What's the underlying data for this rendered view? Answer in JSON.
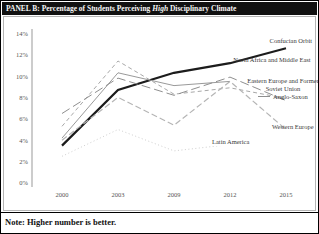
{
  "header": {
    "title_prefix": "PANEL B: Percentage of Students Perceiving ",
    "title_italic": "High",
    "title_suffix": " Disciplinary Climate",
    "bg_color": "#111111",
    "text_color": "#f5f5f5"
  },
  "note": {
    "text": "Note: Higher number is better."
  },
  "chart_data": {
    "type": "line",
    "title": "PANEL B: Percentage of Students Perceiving High Disciplinary Climate",
    "x_labels": [
      "2000",
      "2003",
      "2009",
      "2012",
      "2015"
    ],
    "xlabel": "",
    "ylabel": "",
    "ylim": [
      0,
      14
    ],
    "ytick_labels": [
      "14%",
      "12%",
      "10%",
      "8%",
      "6%",
      "4%",
      "2%",
      "0%"
    ],
    "grid": false,
    "legend_position": "labels-at-line-ends",
    "axis_color": "#999999",
    "series": [
      {
        "name": "Confucian Orbit",
        "values": [
          3.5,
          8.7,
          10.3,
          11.2,
          12.6
        ],
        "style": "solid-thick",
        "color": "#1c1c1c"
      },
      {
        "name": "North Africa and Middle East",
        "values": [
          4.2,
          10.3,
          9.1,
          9.5,
          null
        ],
        "style": "solid",
        "color": "#9a9a9a"
      },
      {
        "name": "Eastern Europe and Former Soviet Union",
        "values": [
          5.3,
          11.4,
          8.3,
          8.9,
          7.9
        ],
        "style": "dashed",
        "color": "#a8a8a8"
      },
      {
        "name": "Anglo-Saxon",
        "values": [
          6.5,
          9.8,
          8.2,
          9.9,
          7.7
        ],
        "style": "long-dash",
        "color": "#8f8f8f"
      },
      {
        "name": "Western Europe",
        "values": [
          4.0,
          8.0,
          5.4,
          9.5,
          5.0
        ],
        "style": "med-dash",
        "color": "#b5b5b5"
      },
      {
        "name": "Latin America",
        "values": [
          2.5,
          5.0,
          3.0,
          3.6,
          null
        ],
        "style": "dotted",
        "color": "#cfcfcf"
      }
    ]
  }
}
